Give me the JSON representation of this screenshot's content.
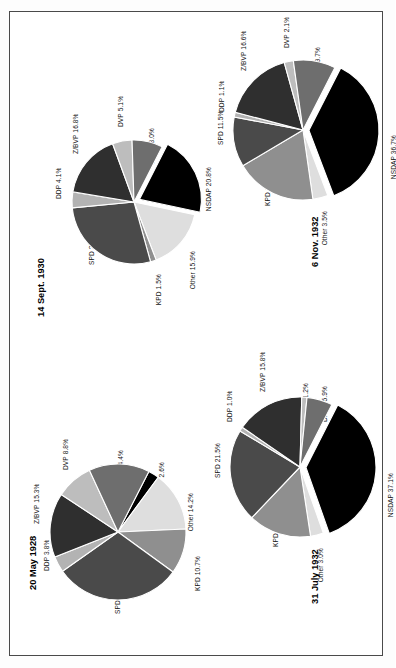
{
  "figure": {
    "orientation": "rotated-90-clockwise",
    "background": "#ffffff",
    "frame_color": "#4a4a4a"
  },
  "palette": {
    "NSDAP": "#000000",
    "DNVP": "#6e6e6e",
    "DVP": "#bdbdbd",
    "Z/BVP": "#2f2f2f",
    "DDP": "#b3b3b3",
    "SPD": "#4a4a4a",
    "KPD": "#8f8f8f",
    "Other": "#dedede"
  },
  "chart_data": [
    {
      "type": "pie",
      "title": "20 May 1928",
      "labels": [
        "NSDAP",
        "Other",
        "KPD",
        "SPD",
        "DDP",
        "Z/BVP",
        "DVP",
        "DNVP"
      ],
      "values": [
        2.6,
        14.2,
        10.7,
        30.2,
        3.8,
        15.3,
        8.8,
        14.4
      ],
      "data_labels": [
        "NSDAP 2.6%",
        "Other 14.2%",
        "KPD 10.7%",
        "SPD 30.2%",
        "DDP 3.8%",
        "Z/BVP 15.3%",
        "DVP 8.8%",
        "DNVP 14.4%"
      ],
      "exploded": [],
      "units": "percent of vote"
    },
    {
      "type": "pie",
      "title": "14 Sept. 1930",
      "labels": [
        "NSDAP",
        "Other",
        "KPD",
        "SPD",
        "DDP",
        "Z/BVP",
        "DVP",
        "DNVP"
      ],
      "values": [
        20.8,
        15.9,
        1.5,
        27.8,
        4.1,
        16.8,
        5.1,
        8.0
      ],
      "data_labels": [
        "NSDAP 20.8%",
        "Other 15.9%",
        "KPD 1.5%",
        "SPD 27.8%",
        "DDP 4.1%",
        "Z/BVP 16.8%",
        "DVP 5.1%",
        "DNVP 8.0%"
      ],
      "exploded": [
        "NSDAP"
      ],
      "units": "percent of vote"
    },
    {
      "type": "pie",
      "title": "31 July 1932",
      "labels": [
        "NSDAP",
        "Other",
        "KPD",
        "SPD",
        "DDP",
        "Z/BVP",
        "DVP",
        "DNVP"
      ],
      "values": [
        37.1,
        3.0,
        14.5,
        21.5,
        1.0,
        15.8,
        1.2,
        5.9
      ],
      "data_labels": [
        "NSDAP 37.1%",
        "Other 3.0%",
        "KPD 14.5%",
        "SPD 21.5%",
        "DDP 1.0%",
        "Z/BVP 15.8%",
        "DVP 1.2%",
        "DNVP 5.9%"
      ],
      "exploded": [
        "NSDAP"
      ],
      "units": "percent of vote"
    },
    {
      "type": "pie",
      "title": "6 Nov. 1932",
      "labels": [
        "NSDAP",
        "Other",
        "KPD",
        "SPD",
        "DDP",
        "Z/BVP",
        "DVP",
        "DNVP"
      ],
      "values": [
        36.7,
        3.5,
        18.7,
        11.5,
        1.1,
        16.6,
        2.1,
        9.7
      ],
      "data_labels": [
        "NSDAP 36.7%",
        "Other 3.5%",
        "KPD 18.7%",
        "SPD 11.5%",
        "DDP 1.1%",
        "Z/BVP 16.6%",
        "DVP 2.1%",
        "DNVP 9.7%"
      ],
      "exploded": [
        "NSDAP"
      ],
      "units": "percent of vote"
    }
  ]
}
